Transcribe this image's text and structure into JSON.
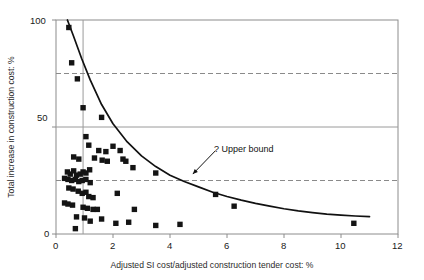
{
  "chart_data": {
    "type": "scatter",
    "title": "",
    "xlabel": "Adjusted SI cost/adjusted construction tender cost: %",
    "ylabel": "Total increase in construction cost: %",
    "xlim": [
      0,
      12
    ],
    "ylim": [
      0,
      100
    ],
    "xticks": [
      0,
      2,
      4,
      6,
      8,
      10,
      12
    ],
    "yticks": [
      0,
      50,
      100
    ],
    "xtick_labels": [
      "0",
      "2",
      "4",
      "6",
      "8",
      "10",
      "12"
    ],
    "ytick_labels": [
      "0",
      "50",
      "100"
    ],
    "grid": "solid horizontal line at y=50, solid vertical line at x=0.95, dashed horizontal lines at y=75 and y=25",
    "gridlines_solid_y": [
      50
    ],
    "gridlines_solid_x": [
      0.95
    ],
    "gridlines_dashed_y": [
      75,
      25
    ],
    "legend": "none",
    "marker": "filled black square",
    "marker_color": "#141414",
    "annotations": [
      {
        "text": "? Upper bound",
        "x": 5.6,
        "y": 39,
        "arrow_to_x": 4.8,
        "arrow_to_y": 28,
        "label": "upper-bound-annotation"
      }
    ],
    "series": [
      {
        "name": "Projects",
        "type": "scatter",
        "points": [
          [
            0.45,
            96.5
          ],
          [
            0.55,
            80.0
          ],
          [
            0.75,
            72.5
          ],
          [
            0.95,
            59.0
          ],
          [
            1.6,
            54.5
          ],
          [
            1.05,
            45.5
          ],
          [
            1.15,
            41.5
          ],
          [
            2.0,
            41.0
          ],
          [
            1.5,
            39.0
          ],
          [
            1.75,
            38.5
          ],
          [
            2.25,
            39.0
          ],
          [
            0.62,
            36.0
          ],
          [
            0.8,
            35.0
          ],
          [
            1.35,
            35.5
          ],
          [
            1.62,
            34.5
          ],
          [
            1.8,
            34.0
          ],
          [
            2.35,
            35.0
          ],
          [
            2.45,
            34.0
          ],
          [
            2.7,
            31.0
          ],
          [
            0.4,
            29.0
          ],
          [
            0.5,
            28.0
          ],
          [
            0.62,
            29.5
          ],
          [
            0.72,
            27.5
          ],
          [
            0.85,
            28.0
          ],
          [
            0.95,
            29.0
          ],
          [
            1.05,
            28.5
          ],
          [
            1.18,
            30.0
          ],
          [
            3.5,
            28.5
          ],
          [
            0.3,
            26.0
          ],
          [
            0.42,
            25.5
          ],
          [
            0.55,
            25.0
          ],
          [
            0.68,
            25.5
          ],
          [
            0.8,
            24.5
          ],
          [
            0.92,
            25.0
          ],
          [
            1.05,
            25.5
          ],
          [
            1.2,
            24.0
          ],
          [
            0.45,
            21.5
          ],
          [
            0.6,
            21.0
          ],
          [
            0.78,
            20.0
          ],
          [
            0.92,
            19.0
          ],
          [
            1.05,
            19.5
          ],
          [
            1.15,
            17.5
          ],
          [
            1.3,
            17.0
          ],
          [
            2.15,
            19.0
          ],
          [
            5.6,
            18.5
          ],
          [
            0.3,
            14.5
          ],
          [
            0.42,
            14.0
          ],
          [
            0.58,
            13.5
          ],
          [
            0.95,
            12.5
          ],
          [
            1.1,
            12.0
          ],
          [
            1.3,
            11.5
          ],
          [
            1.45,
            11.5
          ],
          [
            2.75,
            11.5
          ],
          [
            6.25,
            13.0
          ],
          [
            0.72,
            8.0
          ],
          [
            1.0,
            7.5
          ],
          [
            1.2,
            6.0
          ],
          [
            1.6,
            7.0
          ],
          [
            2.1,
            5.0
          ],
          [
            2.55,
            5.5
          ],
          [
            3.5,
            4.0
          ],
          [
            4.35,
            4.5
          ],
          [
            0.68,
            2.5
          ],
          [
            10.45,
            5.0
          ]
        ]
      },
      {
        "name": "Upper bound curve",
        "type": "line",
        "points": [
          [
            0.4,
            100.0
          ],
          [
            0.6,
            93.0
          ],
          [
            0.9,
            82.0
          ],
          [
            1.2,
            72.0
          ],
          [
            1.6,
            60.5
          ],
          [
            2.0,
            51.5
          ],
          [
            2.5,
            43.0
          ],
          [
            3.0,
            36.5
          ],
          [
            3.5,
            31.5
          ],
          [
            4.0,
            27.5
          ],
          [
            4.5,
            24.5
          ],
          [
            5.0,
            22.0
          ],
          [
            5.5,
            19.5
          ],
          [
            6.0,
            17.5
          ],
          [
            6.5,
            15.8
          ],
          [
            7.0,
            14.3
          ],
          [
            7.5,
            13.0
          ],
          [
            8.0,
            11.8
          ],
          [
            8.5,
            10.8
          ],
          [
            9.0,
            10.0
          ],
          [
            9.5,
            9.3
          ],
          [
            10.0,
            8.8
          ],
          [
            10.5,
            8.4
          ],
          [
            11.0,
            8.1
          ]
        ]
      }
    ]
  },
  "axes": {
    "y_title": "Total increase in construction cost: %",
    "x_title": "Adjusted SI cost/adjusted construction tender cost: %"
  },
  "colors": {
    "marker": "#141414",
    "curve": "#111111",
    "frame": "#8c8c8c",
    "gridline": "#9a9a9a",
    "dashed": "#8a8a8a",
    "text": "#1a1a1a",
    "background": "#ffffff"
  }
}
